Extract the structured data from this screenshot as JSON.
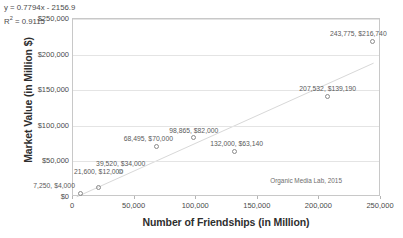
{
  "chart_data": {
    "type": "scatter",
    "title": "",
    "xlabel": "Number of Friendships (in Million)",
    "ylabel": "Market Value (in Million $)",
    "xlim": [
      0,
      250000
    ],
    "ylim": [
      0,
      250000
    ],
    "grid": true,
    "legend": "none",
    "x_ticks": [
      "0",
      "50,000",
      "100,000",
      "150,000",
      "200,000",
      "250,000"
    ],
    "x_tick_values": [
      0,
      50000,
      100000,
      150000,
      200000,
      250000
    ],
    "y_ticks": [
      "$0",
      "$50,000",
      "$100,000",
      "$150,000",
      "$200,000",
      "$250,000"
    ],
    "y_tick_values": [
      0,
      50000,
      100000,
      150000,
      200000,
      250000
    ],
    "points": [
      {
        "x": 7250,
        "y": 4000,
        "label": "7,250, $4,000",
        "label_dx": -6,
        "label_dy": -11,
        "label_align": "left"
      },
      {
        "x": 21600,
        "y": 12000,
        "label": "21,600, $12,000",
        "label_dx": 0,
        "label_dy": -19,
        "label_align": "center"
      },
      {
        "x": 39520,
        "y": 34000,
        "label": "39,520, $34,000",
        "label_dx": 0,
        "label_dy": -12,
        "label_align": "center"
      },
      {
        "x": 68495,
        "y": 70000,
        "label": "68,495, $70,000",
        "label_dx": -8,
        "label_dy": -11,
        "label_align": "center"
      },
      {
        "x": 98865,
        "y": 82000,
        "label": "98,865, $82,000",
        "label_dx": 0,
        "label_dy": -11,
        "label_align": "center"
      },
      {
        "x": 132000,
        "y": 63140,
        "label": "132,000, $63,140",
        "label_dx": 2,
        "label_dy": -11,
        "label_align": "center"
      },
      {
        "x": 207532,
        "y": 139190,
        "label": "207,532, $139,190",
        "label_dx": 0,
        "label_dy": -12,
        "label_align": "center"
      },
      {
        "x": 243775,
        "y": 216740,
        "label": "243,775, $216,740",
        "label_dx": -14,
        "label_dy": -12,
        "label_align": "center"
      }
    ],
    "trendline": {
      "equation": "y = 0.7794x - 2156.9",
      "slope": 0.7794,
      "intercept": -2156.9,
      "r_squared_label": "R",
      "r_squared_sup": "2",
      "r_squared_value": " = 0.9115",
      "r_squared": 0.9115,
      "x_start": 3000,
      "x_end": 244000
    },
    "annotations": [
      {
        "text": "Organic Media Lab, 2015",
        "x": 190000,
        "y": 26000
      }
    ],
    "colors": {
      "marker_stroke": "#8a8a8a",
      "trendline": "#d8d8d8",
      "gridline": "#e4e4e4",
      "axis": "#c8c8c8",
      "text": "#4a4a4a"
    }
  }
}
